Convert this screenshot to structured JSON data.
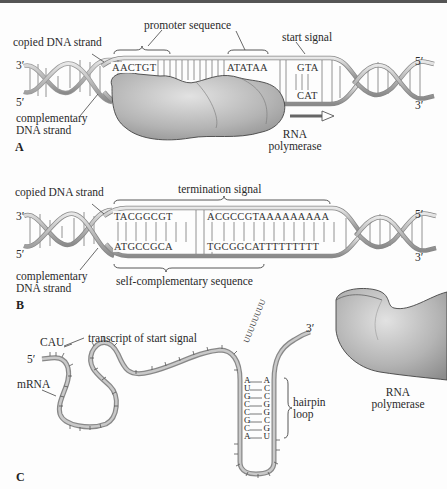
{
  "panels": {
    "A": {
      "panel_label": "A",
      "labels": {
        "copied_strand": "copied DNA strand",
        "complementary_strand_line1": "complementary",
        "complementary_strand_line2": "DNA strand",
        "promoter": "promoter sequence",
        "start_signal": "start signal",
        "polymerase_line1": "RNA",
        "polymerase_line2": "polymerase",
        "left_top_end": "3′",
        "left_bottom_end": "5′",
        "right_top_end": "5′",
        "right_bottom_end": "3′"
      },
      "sequences": {
        "promoter_1": "AACTGT",
        "promoter_2": "ATATAA",
        "start_top": "GTA",
        "start_bottom": "CAT"
      }
    },
    "B": {
      "panel_label": "B",
      "labels": {
        "copied_strand": "copied DNA strand",
        "complementary_strand_line1": "complementary",
        "complementary_strand_line2": "DNA strand",
        "termination": "termination signal",
        "self_complementary": "self-complementary sequence",
        "left_top_end": "3′",
        "left_bottom_end": "5′",
        "right_top_end": "5′",
        "right_bottom_end": "3′"
      },
      "sequences": {
        "top_left": "TACGGCGT",
        "top_right": "ACGCCGTAAAAAAAAA",
        "bottom_left": "ATGCCGCA",
        "bottom_right": "TGCGGCATTTTTTTTT"
      }
    },
    "C": {
      "panel_label": "C",
      "labels": {
        "cau": "CAU",
        "transcript": "transcript of start signal",
        "five_prime": "5′",
        "three_prime": "3′",
        "mrna": "mRNA",
        "hairpin_line1": "hairpin",
        "hairpin_line2": "loop",
        "polymerase_line1": "RNA",
        "polymerase_line2": "polymerase"
      },
      "hairpin_pairs": [
        {
          "left": "A",
          "right": "A"
        },
        {
          "left": "U",
          "right": "C"
        },
        {
          "left": "G",
          "right": "C"
        },
        {
          "left": "C",
          "right": "G"
        },
        {
          "left": "C",
          "right": "G"
        },
        {
          "left": "G",
          "right": "C"
        },
        {
          "left": "C",
          "right": "G"
        },
        {
          "left": "A",
          "right": "U"
        }
      ],
      "u_tail": "UUUUUUUU"
    }
  }
}
